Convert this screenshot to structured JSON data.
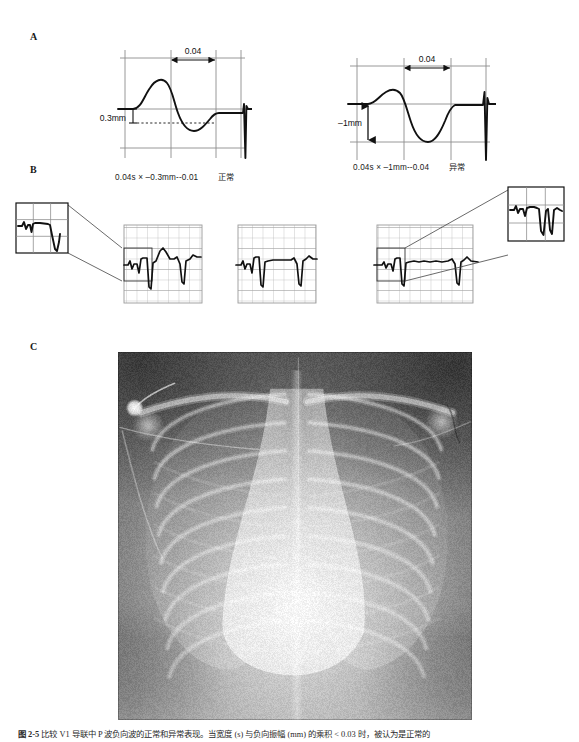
{
  "figure": {
    "panels": {
      "a_label": "A",
      "b_label": "B",
      "c_label": "C"
    },
    "caption": {
      "label": "图 2-5",
      "text": "比较 V1 导联中 P 波负向波的正常和异常表现。当宽度 (s) 与负向振幅 (mm) 的乘积 < 0.03 时，被认为是正常的"
    }
  },
  "panel_a": {
    "left_diagram": {
      "name": "normal-ptf-diagram",
      "interval_label": "0.04",
      "amplitude_label": "0.3mm",
      "formula": "0.04s × –0.3mm--0.01",
      "verdict": "正常"
    },
    "right_diagram": {
      "name": "abnormal-ptf-diagram",
      "interval_label": "0.04",
      "amplitude_label": "–1mm",
      "formula": "0.04s × –1mm--0.04",
      "verdict": "异常"
    }
  },
  "panel_b": {
    "strips": [
      {
        "name": "ecg-strip-1",
        "has_inset": true,
        "inset_position": "upper-left"
      },
      {
        "name": "ecg-strip-2",
        "has_inset": false,
        "inset_position": "none"
      },
      {
        "name": "ecg-strip-3",
        "has_inset": true,
        "inset_position": "upper-right"
      }
    ],
    "inset_left": {
      "name": "ecg-inset-left"
    },
    "inset_right": {
      "name": "ecg-inset-right"
    }
  },
  "panel_c": {
    "image_name": "chest-radiograph",
    "view": "AP"
  },
  "chart_data": {
    "type": "line",
    "xlabel": "time (s)",
    "ylabel": "amplitude (mm)",
    "grid": true,
    "legend": "none",
    "series": [
      {
        "name": "normal P wave (V1)",
        "terminal_duration_s": 0.04,
        "terminal_amplitude_mm": -0.3,
        "ptf_product": -0.01,
        "interpretation": "正常",
        "x": [
          0.0,
          0.01,
          0.02,
          0.03,
          0.04,
          0.05,
          0.06,
          0.07,
          0.08,
          0.09,
          0.1,
          0.11,
          0.12,
          0.14,
          0.16,
          0.18,
          0.2,
          0.22,
          0.24
        ],
        "y": [
          0.0,
          0.05,
          0.35,
          0.8,
          1.05,
          0.95,
          0.55,
          0.1,
          -0.22,
          -0.3,
          -0.28,
          -0.16,
          -0.05,
          0.0,
          0.0,
          0.0,
          0.0,
          0.0,
          0.0
        ]
      },
      {
        "name": "abnormal P wave (V1)",
        "terminal_duration_s": 0.04,
        "terminal_amplitude_mm": -1.0,
        "ptf_product": -0.04,
        "interpretation": "异常",
        "x": [
          0.0,
          0.01,
          0.02,
          0.03,
          0.04,
          0.05,
          0.06,
          0.07,
          0.08,
          0.09,
          0.1,
          0.11,
          0.12,
          0.14,
          0.16,
          0.18,
          0.2,
          0.22,
          0.24
        ],
        "y": [
          0.0,
          0.08,
          0.38,
          0.55,
          0.58,
          0.4,
          -0.1,
          -0.62,
          -0.95,
          -1.0,
          -0.85,
          -0.45,
          -0.1,
          0.0,
          0.0,
          0.0,
          0.0,
          0.0,
          0.0
        ]
      }
    ],
    "annotations": [
      {
        "text": "0.04",
        "refers_to": "terminal-duration",
        "panel": "A-left"
      },
      {
        "text": "0.3mm",
        "refers_to": "terminal-amplitude",
        "panel": "A-left"
      },
      {
        "text": "0.04",
        "refers_to": "terminal-duration",
        "panel": "A-right"
      },
      {
        "text": "–1mm",
        "refers_to": "terminal-amplitude",
        "panel": "A-right"
      }
    ]
  }
}
